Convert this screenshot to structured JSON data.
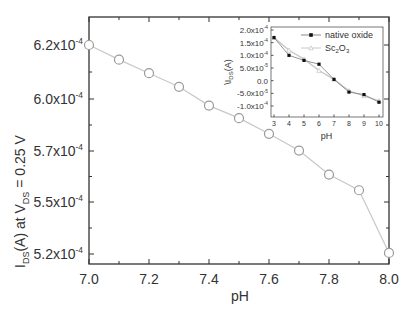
{
  "chart_data": [
    {
      "id": "main",
      "type": "line",
      "title": "",
      "xlabel": "pH",
      "ylabel": "I_DS(A) at V_DS = 0.25 V",
      "ylabel_parts": {
        "pre": "I",
        "sub1": "DS",
        "mid": "(A) at V",
        "sub2": "DS",
        "post": " = 0.25 V"
      },
      "xlim": [
        7.0,
        8.0
      ],
      "ylim": [
        0.000518,
        0.00063
      ],
      "xticks": [
        7.0,
        7.2,
        7.4,
        7.6,
        7.8,
        8.0
      ],
      "xtick_labels": [
        "7.0",
        "7.2",
        "7.4",
        "7.6",
        "7.8",
        "8.0"
      ],
      "yticks": [
        {
          "label_mant": "6.2x10",
          "label_exp": "-4",
          "y_px": 45
        },
        {
          "label_mant": "6.0x10",
          "label_exp": "-4",
          "y_px": 99
        },
        {
          "label_mant": "5.7x10",
          "label_exp": "-4",
          "y_px": 151
        },
        {
          "label_mant": "5.5x10",
          "label_exp": "-4",
          "y_px": 202
        },
        {
          "label_mant": "5.2x10",
          "label_exp": "-4",
          "y_px": 254
        }
      ],
      "grid": false,
      "series": [
        {
          "name": "I_DS",
          "marker": "open-circle",
          "color": "#9a9a9a",
          "x": [
            7.0,
            7.1,
            7.2,
            7.3,
            7.4,
            7.5,
            7.6,
            7.7,
            7.8,
            7.9,
            8.0
          ],
          "values": [
            0.000625,
            0.000618,
            0.0006115,
            0.000605,
            0.000596,
            0.00059,
            0.0005825,
            0.0005745,
            0.000563,
            0.0005555,
            0.0005255
          ]
        }
      ]
    },
    {
      "id": "inset",
      "type": "line",
      "title": "",
      "xlabel": "pH",
      "ylabel": "ΔI_DS(A)",
      "ylabel_parts": {
        "pre": "\\I",
        "sub1": "DS",
        "post": "(A)"
      },
      "xlim": [
        3,
        10
      ],
      "ylim": [
        -0.00012,
        0.0002
      ],
      "xticks": [
        3,
        4,
        5,
        6,
        7,
        8,
        9,
        10
      ],
      "xtick_labels": [
        "3",
        "4",
        "5",
        "6",
        "7",
        "8",
        "9",
        "10"
      ],
      "yticks": [
        {
          "label_mant": "2.0x10",
          "label_exp": "-4",
          "value": 0.0002
        },
        {
          "label_mant": "1.5x10",
          "label_exp": "-4",
          "value": 0.00015
        },
        {
          "label_mant": "1.0x10",
          "label_exp": "-4",
          "value": 0.0001
        },
        {
          "label_mant": "5.0x10",
          "label_exp": "-5",
          "value": 5e-05
        },
        {
          "label_mant": "0.0",
          "label_exp": "",
          "value": 0
        },
        {
          "label_mant": "-5.0x10",
          "label_exp": "-5",
          "value": -5e-05
        },
        {
          "label_mant": "-1.0x10",
          "label_exp": "-4",
          "value": -0.0001
        }
      ],
      "grid": false,
      "legend_position": "upper right",
      "series": [
        {
          "name": "native oxide",
          "name_parts": {
            "text": "native oxide"
          },
          "marker": "filled-square",
          "color": "#111111",
          "line_color": "#8a8a8a",
          "x": [
            3,
            4,
            5,
            6,
            7,
            8,
            9,
            10
          ],
          "values": [
            0.00017,
            0.0001,
            8e-05,
            6.5e-05,
            5e-06,
            -4.5e-05,
            -5.5e-05,
            -8.5e-05
          ]
        },
        {
          "name": "Sc2O3",
          "name_parts": {
            "pre": "Sc",
            "sub1": "2",
            "mid": "O",
            "sub2": "3"
          },
          "marker": "open-triangle",
          "color": "#c0c0c0",
          "line_color": "#c8c8c8",
          "x": [
            3,
            4,
            5,
            6,
            7,
            8,
            9,
            10
          ],
          "values": [
            0.00017,
            0.00012,
            8.5e-05,
            4e-05,
            5e-06,
            -4e-05,
            -6e-05,
            -8e-05
          ]
        }
      ]
    }
  ]
}
